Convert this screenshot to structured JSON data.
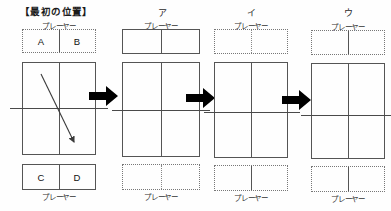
{
  "figure": {
    "title": "【最初の位置】",
    "player_label": "プレーヤー",
    "colors": {
      "court_line": "#555555",
      "net_line": "#4a4a4a",
      "arrow_fill": "#000000",
      "dotted_line": "#888888",
      "text": "#222222"
    }
  },
  "panels": [
    {
      "id": "initial",
      "label": "【最初の位置】",
      "top_bench": {
        "border": "dotted",
        "divider": "solid",
        "cells": [
          "A",
          "B"
        ],
        "label": "プレーヤー",
        "label_position": "above"
      },
      "bottom_bench": {
        "border": "solid",
        "divider": "solid",
        "cells": [
          "C",
          "D"
        ],
        "label": "プレーヤー",
        "label_position": "below"
      },
      "court": {
        "border": "solid",
        "center_line": "solid",
        "net": "solid"
      },
      "trajectory_arrow": true
    },
    {
      "id": "a",
      "label": "ア",
      "top_bench": {
        "border": "solid",
        "divider": "solid",
        "cells": [
          "",
          ""
        ],
        "label": "プレーヤー",
        "label_position": "above"
      },
      "bottom_bench": {
        "border": "dotted",
        "divider": "dotted",
        "cells": [
          "",
          ""
        ],
        "label": "プレーヤー",
        "label_position": "below"
      },
      "court": {
        "border": "solid",
        "center_line": "solid",
        "net": "solid"
      },
      "trajectory_arrow": false
    },
    {
      "id": "i",
      "label": "イ",
      "top_bench": {
        "border": "dotted",
        "divider": "dotted",
        "cells": [
          "",
          ""
        ],
        "label": "プレーヤー",
        "label_position": "above"
      },
      "bottom_bench": {
        "border": "dotted",
        "divider": "solid",
        "cells": [
          "",
          ""
        ],
        "label": "プレーヤー",
        "label_position": "below"
      },
      "court": {
        "border": "solid",
        "center_line": "solid",
        "net": "solid"
      },
      "trajectory_arrow": false
    },
    {
      "id": "u",
      "label": "ウ",
      "top_bench": {
        "border": "dotted",
        "divider": "solid",
        "cells": [
          "",
          ""
        ],
        "label": "プレーヤー",
        "label_position": "above"
      },
      "bottom_bench": {
        "border": "dotted",
        "divider": "solid",
        "cells": [
          "",
          ""
        ],
        "label": "プレーヤー",
        "label_position": "below"
      },
      "court": {
        "border": "solid",
        "center_line": "solid",
        "net": "solid"
      },
      "trajectory_arrow": false
    }
  ],
  "transition_arrows": [
    {
      "id": "arrow-1",
      "direction": "right"
    },
    {
      "id": "arrow-2",
      "direction": "right"
    },
    {
      "id": "arrow-3",
      "direction": "right"
    }
  ]
}
